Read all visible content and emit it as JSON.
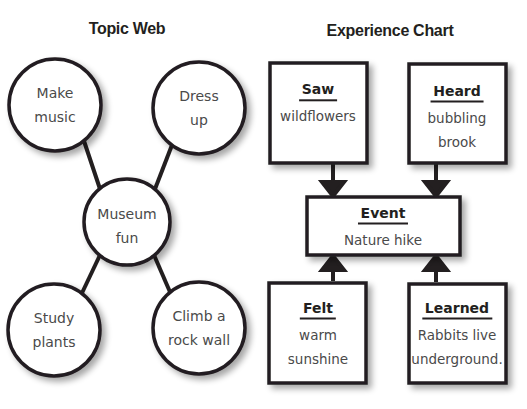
{
  "topic_web": {
    "title": "Topic Web",
    "center": {
      "line1": "Museum",
      "line2": "fun"
    },
    "nodes": [
      {
        "line1": "Make",
        "line2": "music"
      },
      {
        "line1": "Dress",
        "line2": "up"
      },
      {
        "line1": "Study",
        "line2": "plants"
      },
      {
        "line1": "Climb a",
        "line2": "rock wall"
      }
    ]
  },
  "experience_chart": {
    "title": "Experience Chart",
    "event": {
      "heading": "Event",
      "line1": "Nature hike"
    },
    "boxes": [
      {
        "heading": "Saw",
        "line1": "wildflowers",
        "line2": ""
      },
      {
        "heading": "Heard",
        "line1": "bubbling",
        "line2": "brook"
      },
      {
        "heading": "Felt",
        "line1": "warm",
        "line2": "sunshine"
      },
      {
        "heading": "Learned",
        "line1": "Rabbits live",
        "line2": "underground."
      }
    ]
  },
  "colors": {
    "stroke": "#231f20",
    "text": "#4a4a4a",
    "shadow": "#bdbdbd"
  }
}
